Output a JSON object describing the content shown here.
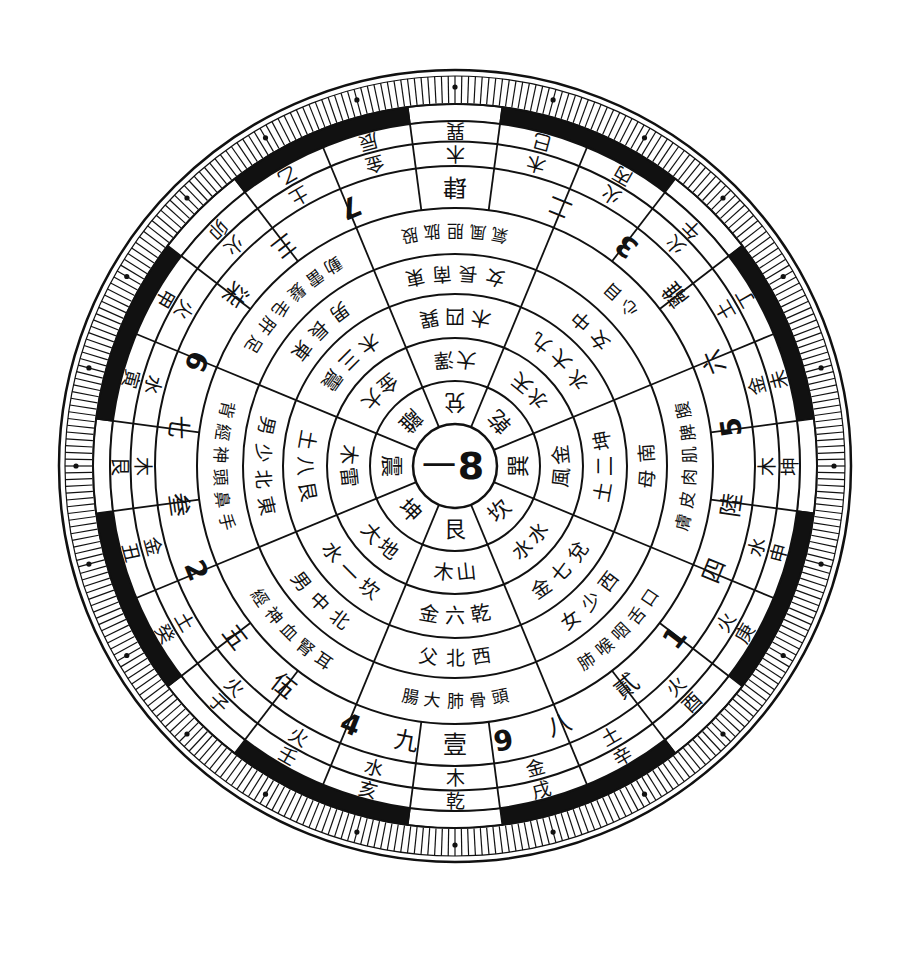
{
  "diagram": {
    "type": "luopan-compass",
    "center": {
      "x": 455,
      "y": 466
    },
    "center_label": {
      "left": "一",
      "right": "8"
    },
    "colors": {
      "ink": "#111111",
      "paper": "#ffffff"
    },
    "radii": {
      "center": 42,
      "r1": 85,
      "r2": 128,
      "r3": 172,
      "r4": 212,
      "r5": 258,
      "r6": 300,
      "r7": 345,
      "band": 362,
      "tick_outer": 396
    },
    "ring1_trigrams": {
      "sectors": 8,
      "start_deg": -112.5,
      "labels": [
        "兌",
        "乾",
        "巽",
        "坎",
        "艮",
        "坤",
        "震",
        "離"
      ]
    },
    "ring2_elements": {
      "sectors": 8,
      "start_deg": -112.5,
      "labels": [
        "澤大",
        "天水",
        "金風",
        "水水",
        "山木",
        "地大",
        "雷木",
        "大金"
      ]
    },
    "ring3_numbers": {
      "sectors": 8,
      "start_deg": -112.5,
      "labels": [
        "巽四木",
        "九大水",
        "坤二土",
        "兌七金",
        "乾六金",
        "坎一水",
        "艮八土",
        "震三木"
      ]
    },
    "ring4_family": {
      "sectors": 8,
      "start_deg": -112.5,
      "labels": [
        "東南長女",
        "中女",
        "南母",
        "西少女",
        "西北父",
        "北中男",
        "東北少男",
        "東長男"
      ]
    },
    "ring5_organs": {
      "sectors": 8,
      "start_deg": -112.5,
      "labels": [
        "股肱胆風氣",
        "目心",
        "腹脾肌肉皮膚",
        "口舌咽喉肺",
        "頭骨肺大腸",
        "耳腎血神經",
        "手鼻頭神經背",
        "足肝毛髮雷動"
      ]
    },
    "ring6_stars": {
      "sectors": 12,
      "start_deg": -105,
      "labels": [
        "7",
        "二",
        "3",
        "離",
        "六",
        "5",
        "陸",
        "四",
        "1",
        "貳",
        "八",
        "9",
        "壹",
        "九",
        "4",
        "伍",
        "五",
        "2",
        "叁",
        "七",
        "6",
        "柒",
        "三",
        "肆"
      ]
    },
    "ring6_cells": [
      {
        "angle": -90,
        "text": "肆"
      },
      {
        "angle": -68,
        "text": "二"
      },
      {
        "angle": -52,
        "text": "3"
      },
      {
        "angle": -38,
        "text": "離"
      },
      {
        "angle": -22,
        "text": "六"
      },
      {
        "angle": -8,
        "text": "5"
      },
      {
        "angle": 8,
        "text": "陸"
      },
      {
        "angle": 22,
        "text": "四"
      },
      {
        "angle": 38,
        "text": "1"
      },
      {
        "angle": 52,
        "text": "貳"
      },
      {
        "angle": 68,
        "text": "八"
      },
      {
        "angle": 80,
        "text": "9"
      },
      {
        "angle": 90,
        "text": "壹"
      },
      {
        "angle": 100,
        "text": "九"
      },
      {
        "angle": 112,
        "text": "4"
      },
      {
        "angle": 128,
        "text": "伍"
      },
      {
        "angle": 142,
        "text": "五"
      },
      {
        "angle": 158,
        "text": "2"
      },
      {
        "angle": 172,
        "text": "叁"
      },
      {
        "angle": 188,
        "text": "七"
      },
      {
        "angle": 202,
        "text": "6"
      },
      {
        "angle": 218,
        "text": "柒"
      },
      {
        "angle": 232,
        "text": "三"
      },
      {
        "angle": 248,
        "text": "7"
      }
    ],
    "ring7_elements": [
      {
        "angle": -90,
        "text": "木"
      },
      {
        "angle": -75,
        "text": "木"
      },
      {
        "angle": -60,
        "text": "火"
      },
      {
        "angle": -45,
        "text": "火"
      },
      {
        "angle": -30,
        "text": "土"
      },
      {
        "angle": -15,
        "text": "金"
      },
      {
        "angle": 0,
        "text": "木"
      },
      {
        "angle": 15,
        "text": "水"
      },
      {
        "angle": 30,
        "text": "火"
      },
      {
        "angle": 45,
        "text": "火"
      },
      {
        "angle": 60,
        "text": "土"
      },
      {
        "angle": 75,
        "text": "金"
      },
      {
        "angle": 90,
        "text": "木"
      },
      {
        "angle": 105,
        "text": "水"
      },
      {
        "angle": 120,
        "text": "火"
      },
      {
        "angle": 135,
        "text": "火"
      },
      {
        "angle": 150,
        "text": "土"
      },
      {
        "angle": 165,
        "text": "金"
      },
      {
        "angle": 180,
        "text": "木"
      },
      {
        "angle": 195,
        "text": "水"
      },
      {
        "angle": 210,
        "text": "火"
      },
      {
        "angle": 225,
        "text": "火"
      },
      {
        "angle": 240,
        "text": "土"
      },
      {
        "angle": 255,
        "text": "金"
      }
    ],
    "ring8_mountains": [
      {
        "angle": -90,
        "text": "巽"
      },
      {
        "angle": -75,
        "text": "巳"
      },
      {
        "angle": -60,
        "text": "丙"
      },
      {
        "angle": -45,
        "text": "午"
      },
      {
        "angle": -30,
        "text": "丁"
      },
      {
        "angle": -15,
        "text": "未"
      },
      {
        "angle": 0,
        "text": "坤"
      },
      {
        "angle": 15,
        "text": "申"
      },
      {
        "angle": 30,
        "text": "庚"
      },
      {
        "angle": 45,
        "text": "酉"
      },
      {
        "angle": 60,
        "text": "辛"
      },
      {
        "angle": 75,
        "text": "戌"
      },
      {
        "angle": 90,
        "text": "乾"
      },
      {
        "angle": 105,
        "text": "亥"
      },
      {
        "angle": 120,
        "text": "壬"
      },
      {
        "angle": 135,
        "text": "子"
      },
      {
        "angle": 150,
        "text": "癸"
      },
      {
        "angle": 165,
        "text": "丑"
      },
      {
        "angle": 180,
        "text": "艮"
      },
      {
        "angle": 195,
        "text": "寅"
      },
      {
        "angle": 210,
        "text": "甲"
      },
      {
        "angle": 225,
        "text": "卯"
      },
      {
        "angle": 240,
        "text": "乙"
      },
      {
        "angle": 255,
        "text": "辰"
      }
    ],
    "band_pattern": {
      "description": "alternating black/white arc segments",
      "segments": [
        {
          "from": -97.5,
          "to": -82.5,
          "fill": "#ffffff"
        },
        {
          "from": -82.5,
          "to": -52.5,
          "fill": "#111111"
        },
        {
          "from": -52.5,
          "to": -37.5,
          "fill": "#ffffff"
        },
        {
          "from": -37.5,
          "to": -7.5,
          "fill": "#111111"
        },
        {
          "from": -7.5,
          "to": 7.5,
          "fill": "#ffffff"
        },
        {
          "from": 7.5,
          "to": 37.5,
          "fill": "#111111"
        },
        {
          "from": 37.5,
          "to": 52.5,
          "fill": "#ffffff"
        },
        {
          "from": 52.5,
          "to": 82.5,
          "fill": "#111111"
        },
        {
          "from": 82.5,
          "to": 97.5,
          "fill": "#ffffff"
        },
        {
          "from": 97.5,
          "to": 127.5,
          "fill": "#111111"
        },
        {
          "from": 127.5,
          "to": 142.5,
          "fill": "#ffffff"
        },
        {
          "from": 142.5,
          "to": 172.5,
          "fill": "#111111"
        },
        {
          "from": 172.5,
          "to": 187.5,
          "fill": "#ffffff"
        },
        {
          "from": 187.5,
          "to": 217.5,
          "fill": "#111111"
        },
        {
          "from": 217.5,
          "to": 232.5,
          "fill": "#ffffff"
        },
        {
          "from": 232.5,
          "to": 262.5,
          "fill": "#111111"
        }
      ]
    },
    "tick_count": 360,
    "dot_markers_every_deg": 15
  }
}
